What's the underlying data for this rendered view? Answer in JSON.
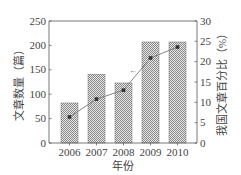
{
  "chart_data": {
    "type": "bar+line",
    "title": "",
    "xlabel": "年份",
    "ylabel": "文章数量（篇）",
    "ylabel_right": "我国文章百分比（%）",
    "categories": [
      "2006",
      "2007",
      "2008",
      "2009",
      "2010"
    ],
    "series": [
      {
        "name": "文章数量",
        "type": "bar",
        "axis": "left",
        "values": [
          82,
          141,
          123,
          207,
          207
        ]
      },
      {
        "name": "我国文章百分比",
        "type": "line",
        "axis": "right",
        "values": [
          6.4,
          10.8,
          13.0,
          20.9,
          23.6
        ]
      }
    ],
    "ylim": [
      0,
      250
    ],
    "ylim_right": [
      0,
      30
    ],
    "yticks": [
      0,
      50,
      100,
      150,
      200,
      250
    ],
    "yticks_right": [
      0,
      5,
      10,
      15,
      20,
      25,
      30
    ],
    "annotations": [
      {
        "text": "←",
        "near": "2008-2009 line segment, points to right axis"
      }
    ],
    "grid": false,
    "legend": "none"
  },
  "colors": {
    "bar_fill": "#b8b8b8",
    "bar_edge": "#777777",
    "line": "#777777",
    "marker": "#333333",
    "axis": "#555555"
  }
}
